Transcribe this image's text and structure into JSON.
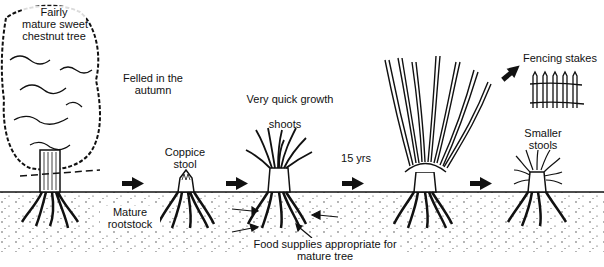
{
  "diagram": {
    "colors": {
      "ink": "#111111",
      "background": "#ffffff",
      "soil_dots": "#333333"
    },
    "stages": [
      {
        "id": "mature-tree",
        "label_line1": "Fairly",
        "label_line2": "mature sweet",
        "label_line3": "chestnut tree"
      },
      {
        "id": "coppice-stool",
        "label_line1": "Coppice",
        "label_line2": "stool"
      },
      {
        "id": "quick-growth",
        "label_top": "Very quick growth",
        "label_shoots": "shoots"
      },
      {
        "id": "grown-poles",
        "label": "15 yrs"
      },
      {
        "id": "smaller-stools",
        "label_line1": "Smaller",
        "label_line2": "stools"
      }
    ],
    "annotations": {
      "felled_line1": "Felled in the",
      "felled_line2": "autumn",
      "rootstock_line1": "Mature",
      "rootstock_line2": "rootstock",
      "food_line1": "Food supplies appropriate for",
      "food_line2": "mature tree",
      "fencing": "Fencing stakes",
      "interval": "15 yrs"
    },
    "arrows": [
      {
        "from": "mature-tree",
        "to": "coppice-stool"
      },
      {
        "from": "coppice-stool",
        "to": "quick-growth"
      },
      {
        "from": "quick-growth",
        "to": "grown-poles"
      },
      {
        "from": "grown-poles",
        "to": "smaller-stools"
      },
      {
        "from": "grown-poles",
        "to": "fencing-stakes"
      }
    ]
  }
}
